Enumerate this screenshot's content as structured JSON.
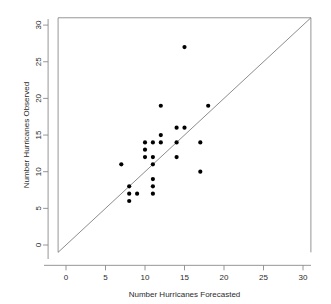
{
  "chart_data": {
    "type": "scatter",
    "title": "",
    "xlabel": "Number Hurricanes Forecasted",
    "ylabel": "Number Hurricanes Observed",
    "xlim": [
      -1,
      31
    ],
    "ylim": [
      -1,
      31
    ],
    "xticks": [
      0,
      5,
      10,
      15,
      20,
      25,
      30
    ],
    "yticks": [
      0,
      5,
      10,
      15,
      20,
      25,
      30
    ],
    "xtick_labels": [
      "0",
      "5",
      "10",
      "15",
      "20",
      "25",
      "30"
    ],
    "ytick_labels": [
      "0",
      "5",
      "10",
      "15",
      "20",
      "25",
      "30"
    ],
    "grid": false,
    "legend": null,
    "marker": "filled-circle",
    "marker_color": "#000000",
    "reference_line": {
      "name": "identity-line",
      "type": "line",
      "equation": "y = x",
      "from": [
        -1,
        -1
      ],
      "to": [
        31,
        31
      ],
      "color": "#6e6e6e"
    },
    "points": [
      {
        "x": 7,
        "y": 11
      },
      {
        "x": 8,
        "y": 8
      },
      {
        "x": 8,
        "y": 7
      },
      {
        "x": 8,
        "y": 6
      },
      {
        "x": 9,
        "y": 7
      },
      {
        "x": 10,
        "y": 14
      },
      {
        "x": 10,
        "y": 13
      },
      {
        "x": 10,
        "y": 12
      },
      {
        "x": 11,
        "y": 14
      },
      {
        "x": 11,
        "y": 12
      },
      {
        "x": 11,
        "y": 11
      },
      {
        "x": 11,
        "y": 9
      },
      {
        "x": 11,
        "y": 8
      },
      {
        "x": 11,
        "y": 7
      },
      {
        "x": 12,
        "y": 19
      },
      {
        "x": 12,
        "y": 15
      },
      {
        "x": 12,
        "y": 14
      },
      {
        "x": 14,
        "y": 16
      },
      {
        "x": 14,
        "y": 14
      },
      {
        "x": 14,
        "y": 12
      },
      {
        "x": 15,
        "y": 27
      },
      {
        "x": 15,
        "y": 16
      },
      {
        "x": 17,
        "y": 14
      },
      {
        "x": 17,
        "y": 10
      },
      {
        "x": 18,
        "y": 19
      }
    ],
    "n_points": 25
  },
  "axis": {
    "x_title": "Number Hurricanes Forecasted",
    "y_title": "Number Hurricanes Observed"
  }
}
